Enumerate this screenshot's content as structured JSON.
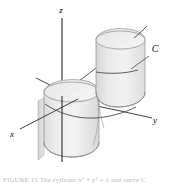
{
  "figure": {
    "background_color": "#ffffff",
    "surface_fill_light": "#eeeeee",
    "surface_fill_mid": "#e2e2e2",
    "surface_fill_dark": "#d4d4d4",
    "outline_color": "#8a8a8a",
    "axis_color": "#2b2b2b",
    "curve_color": "#3a3a3a",
    "axes": [
      {
        "name": "z-axis",
        "label": "z",
        "label_x": 61,
        "label_y": 13
      },
      {
        "name": "x-axis",
        "label": "x",
        "label_x": 12,
        "label_y": 137
      },
      {
        "name": "y-axis",
        "label": "y",
        "label_x": 155,
        "label_y": 123
      }
    ],
    "curve": {
      "name": "curve-c",
      "label": "C",
      "label_x": 155,
      "label_y": 52
    },
    "caption": "FIGURE 15  The cylinder x² + y² = 1 and curve C"
  }
}
